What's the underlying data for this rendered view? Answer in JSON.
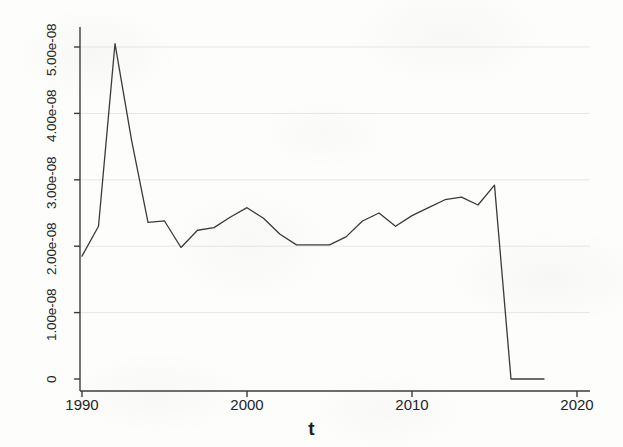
{
  "chart_data": {
    "type": "line",
    "title": "",
    "xlabel": "t",
    "ylabel": "TextEXP_GDP",
    "xlim": [
      1989.0,
      2020.0
    ],
    "ylim": [
      0,
      5.4e-08
    ],
    "grid": true,
    "legend": null,
    "legend_position": "none",
    "line_color": "#3a3a3a",
    "xticks": [
      1990,
      2000,
      2010,
      2020
    ],
    "xtick_labels": [
      "1990",
      "2000",
      "2010",
      "2020"
    ],
    "yticks": [
      0,
      1e-08,
      2e-08,
      3e-08,
      4e-08,
      5e-08
    ],
    "ytick_labels": [
      "0",
      "1.00e-08",
      "2.00e-08",
      "3.00e-08",
      "4.00e-08",
      "5.00e-08"
    ],
    "series": [
      {
        "name": "TextEXP_GDP",
        "x": [
          1990,
          1991,
          1992,
          1993,
          1994,
          1995,
          1996,
          1997,
          1998,
          1999,
          2000,
          2001,
          2002,
          2003,
          2004,
          2005,
          2006,
          2007,
          2008,
          2009,
          2010,
          2011,
          2012,
          2013,
          2014,
          2015,
          2016,
          2017,
          2018
        ],
        "y": [
          1.85e-08,
          2.3e-08,
          5.05e-08,
          3.6e-08,
          2.36e-08,
          2.38e-08,
          1.98e-08,
          2.24e-08,
          2.28e-08,
          2.44e-08,
          2.58e-08,
          2.42e-08,
          2.18e-08,
          2.02e-08,
          2.02e-08,
          2.02e-08,
          2.14e-08,
          2.38e-08,
          2.5e-08,
          2.3e-08,
          2.46e-08,
          2.58e-08,
          2.7e-08,
          2.74e-08,
          2.62e-08,
          2.92e-08,
          0.0,
          0.0,
          0.0
        ]
      }
    ]
  },
  "axis": {
    "ylabel_text": "TextEXP_GDP",
    "xlabel_text": "t"
  }
}
